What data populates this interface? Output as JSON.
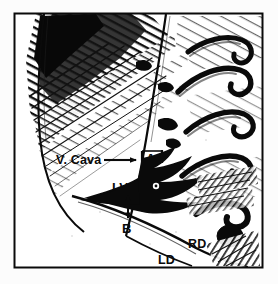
{
  "figure": {
    "background_color": "#fcfcfc",
    "ink_color": "#0a0a0a",
    "frame": {
      "color": "#0a0a0a",
      "x": 14,
      "y": 13,
      "width": 249,
      "height": 255
    },
    "labels": {
      "vena_cava": "V. Cava",
      "atrium": "A",
      "left_ventricle": "LV",
      "measure_b": "B",
      "right_diaphragm": "RD",
      "left_diaphragm": "LD"
    },
    "annotations": {
      "vcava_arrow": "arrow pointing right from V. Cava label to A bracket",
      "a_bracket": "horizontal measurement bracket spanning segment A",
      "b_arrow": "vertical double-headed measurement arrow for segment B"
    }
  }
}
